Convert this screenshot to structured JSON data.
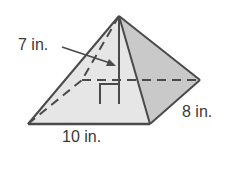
{
  "figure": {
    "type": "rectangular pyramid",
    "labels": {
      "height": "7 in.",
      "base_length": "10 in.",
      "base_width": "8 in."
    },
    "colors": {
      "front_face": "#e6e6e6",
      "right_face": "#c9c9c9",
      "stroke": "#4a4a4a"
    }
  }
}
